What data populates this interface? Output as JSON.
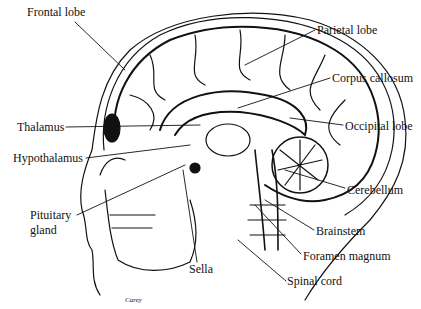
{
  "diagram": {
    "labels": [
      {
        "id": "frontal-lobe",
        "text": "Frontal lobe",
        "x": 27,
        "y": 12
      },
      {
        "id": "parietal-lobe",
        "text": "Parietal lobe",
        "x": 317,
        "y": 24
      },
      {
        "id": "corpus-callosum",
        "text": "Corpus callosum",
        "x": 332,
        "y": 72
      },
      {
        "id": "thalamus",
        "text": "Thalamus",
        "x": 17,
        "y": 121
      },
      {
        "id": "occipital-lobe",
        "text": "Occipital lobe",
        "x": 345,
        "y": 120
      },
      {
        "id": "hypothalamus",
        "text": "Hypothalamus",
        "x": 13,
        "y": 154
      },
      {
        "id": "cerebellum",
        "text": "Cerebellum",
        "x": 347,
        "y": 184
      },
      {
        "id": "pituitary-gland-1",
        "text": "Pituitary",
        "x": 30,
        "y": 211
      },
      {
        "id": "pituitary-gland-2",
        "text": "gland",
        "x": 30,
        "y": 226
      },
      {
        "id": "brainstem",
        "text": "Brainstem",
        "x": 316,
        "y": 225
      },
      {
        "id": "sella",
        "text": "Sella",
        "x": 189,
        "y": 264
      },
      {
        "id": "foramen-magnum",
        "text": "Foramen magnum",
        "x": 303,
        "y": 250
      },
      {
        "id": "spinal-cord",
        "text": "Spinal cord",
        "x": 287,
        "y": 275
      }
    ],
    "signature": "Carey",
    "line_color": "#111111",
    "background": "#ffffff"
  }
}
